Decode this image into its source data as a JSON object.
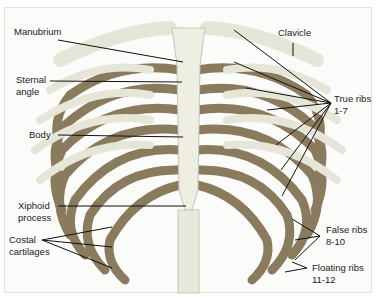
{
  "diagram": {
    "colors": {
      "bone": "#e6e6d8",
      "bone_shadow": "#b9b6a0",
      "cartilage": "#8a7a5e",
      "leader_line": "#111111",
      "background": "#fbfbf9"
    },
    "labels": [
      {
        "id": "manubrium",
        "text": "Manubrium"
      },
      {
        "id": "sternal-angle",
        "text": "Sternal\nangle"
      },
      {
        "id": "body",
        "text": "Body"
      },
      {
        "id": "xiphoid-process",
        "text": "Xiphoid\nprocess"
      },
      {
        "id": "costal-cartilages",
        "text": "Costal\ncartilages"
      },
      {
        "id": "clavicle",
        "text": "Clavicle"
      },
      {
        "id": "true-ribs",
        "text": "True ribs\n1-7"
      },
      {
        "id": "false-ribs",
        "text": "False ribs\n8-10"
      },
      {
        "id": "floating-ribs",
        "text": "Floating ribs\n11-12"
      }
    ]
  }
}
